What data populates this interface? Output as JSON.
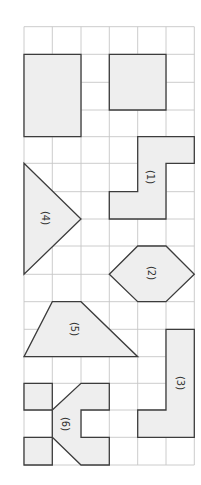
{
  "diagram": {
    "grid": {
      "x_lines": [
        24,
        52.3,
        81,
        109.3,
        137.7,
        166,
        194.3
      ],
      "y_lines": [
        26.7,
        54.3,
        82.3,
        110,
        136.7,
        163.3,
        191.7,
        219,
        246,
        274.3,
        301.7,
        329.3,
        356.7,
        383.3,
        410,
        437.3,
        465
      ],
      "columns": 6,
      "rows": 16,
      "line_color": "#c6c6c6"
    },
    "colors": {
      "shape_fill": "#eeeeee",
      "shape_stroke": "#3c3c3c",
      "label_color": "#333333"
    },
    "shapes": [
      {
        "id": "rectangle-unlabeled",
        "label": "",
        "points": "24,54.3 81,54.3 81,136.7 24,136.7"
      },
      {
        "id": "square-unlabeled",
        "label": "",
        "points": "109.3,54.3 166,54.3 166,110 109.3,110"
      },
      {
        "id": "shape-1",
        "label": "(1)",
        "points": "137.7,136.7 194.3,136.7 194.3,163.3 166,163.3 166,219 109.3,219 109.3,191.7 137.7,191.7",
        "label_pos": [
          150,
          177
        ]
      },
      {
        "id": "shape-4",
        "label": "(4)",
        "points": "24,163.3 81,219 24,274.3",
        "label_pos": [
          45,
          218
        ]
      },
      {
        "id": "shape-2",
        "label": "(2)",
        "points": "109.3,274.3 137.7,246 166,246 194.3,274.3 166,301.7 137.7,301.7",
        "label_pos": [
          151,
          273
        ]
      },
      {
        "id": "shape-5",
        "label": "(5)",
        "points": "52.3,301.7 81,301.7 137.7,356.7 24,356.7",
        "label_pos": [
          74,
          329
        ]
      },
      {
        "id": "shape-3",
        "label": "(3)",
        "points": "166,329.3 194.3,329.3 194.3,437.3 137.7,437.3 137.7,410 166,410",
        "label_pos": [
          180,
          383
        ]
      },
      {
        "id": "shape-6-top-square",
        "label": "",
        "points": "24,383.3 52.3,383.3 52.3,410 24,410"
      },
      {
        "id": "shape-6-bottom-square",
        "label": "",
        "points": "24,437.3 52.3,437.3 52.3,465 24,465"
      },
      {
        "id": "shape-6",
        "label": "(6)",
        "points": "52.3,410 81,383.3 109.3,383.3 109.3,410 81,410 81,437.3 109.3,437.3 109.3,465 81,465 52.3,437.3",
        "label_pos": [
          65,
          424
        ]
      }
    ]
  }
}
